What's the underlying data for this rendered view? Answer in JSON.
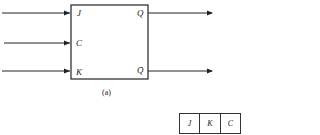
{
  "diagram": {
    "inputs": [
      "J",
      "C",
      "K"
    ],
    "outputs": [
      "Q",
      "Q̄"
    ],
    "caption": "(a)"
  },
  "table": {
    "headers": [
      "J",
      "K",
      "C"
    ]
  }
}
